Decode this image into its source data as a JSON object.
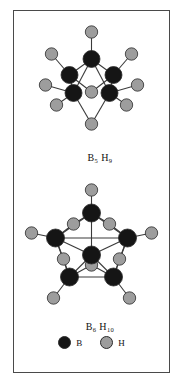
{
  "figure": {
    "background_color": "#ffffff",
    "border_color": "#4a4a4a",
    "atom_colors": {
      "boron": "#151515",
      "hydrogen": "#9d9d9d",
      "bond": "#3a3a3a",
      "outline": "#2b2b2b"
    }
  },
  "structures": [
    {
      "id": "pentaborane",
      "formula_element": "B",
      "formula_sub1": "5",
      "formula_element2": "H",
      "formula_sub2": "9",
      "formula_plain": "B5 H9",
      "boron_count": 5,
      "hydrogen_count": 9,
      "atoms": [
        {
          "label": "B",
          "type": "boron",
          "x": 62,
          "y": 36,
          "r": 8.5
        },
        {
          "label": "B",
          "type": "boron",
          "x": 40,
          "y": 52,
          "r": 8.5
        },
        {
          "label": "B",
          "type": "boron",
          "x": 84,
          "y": 52,
          "r": 8.5
        },
        {
          "label": "B",
          "type": "boron",
          "x": 44,
          "y": 70,
          "r": 8.5
        },
        {
          "label": "B",
          "type": "boron",
          "x": 80,
          "y": 70,
          "r": 8.5
        },
        {
          "label": "H",
          "type": "hydrogen",
          "x": 62,
          "y": 9,
          "r": 6.2
        },
        {
          "label": "H",
          "type": "hydrogen",
          "x": 22,
          "y": 31,
          "r": 6.2
        },
        {
          "label": "H",
          "type": "hydrogen",
          "x": 102,
          "y": 31,
          "r": 6.2
        },
        {
          "label": "H",
          "type": "hydrogen",
          "x": 16,
          "y": 62,
          "r": 6.2
        },
        {
          "label": "H",
          "type": "hydrogen",
          "x": 108,
          "y": 62,
          "r": 6.2
        },
        {
          "label": "H",
          "type": "hydrogen",
          "x": 27,
          "y": 82,
          "r": 6.2
        },
        {
          "label": "H",
          "type": "hydrogen",
          "x": 97,
          "y": 82,
          "r": 6.2
        },
        {
          "label": "H",
          "type": "hydrogen",
          "x": 62,
          "y": 69,
          "r": 6.2
        },
        {
          "label": "H",
          "type": "hydrogen",
          "x": 62,
          "y": 101,
          "r": 6.2
        }
      ],
      "bonds": [
        {
          "from": 0,
          "to": 5
        },
        {
          "from": 0,
          "to": 1
        },
        {
          "from": 0,
          "to": 2
        },
        {
          "from": 0,
          "to": 3
        },
        {
          "from": 0,
          "to": 4
        },
        {
          "from": 1,
          "to": 3
        },
        {
          "from": 2,
          "to": 4
        },
        {
          "from": 1,
          "to": 6
        },
        {
          "from": 2,
          "to": 7
        },
        {
          "from": 3,
          "to": 8
        },
        {
          "from": 4,
          "to": 9
        },
        {
          "from": 3,
          "to": 10
        },
        {
          "from": 4,
          "to": 11
        },
        {
          "from": 1,
          "to": 12
        },
        {
          "from": 2,
          "to": 12
        },
        {
          "from": 3,
          "to": 13
        },
        {
          "from": 4,
          "to": 13
        }
      ]
    },
    {
      "id": "hexaborane",
      "formula_element": "B",
      "formula_sub1": "6",
      "formula_element2": "H",
      "formula_sub2": "10",
      "formula_plain": "B6 H10",
      "boron_count": 6,
      "hydrogen_count": 10,
      "atoms": [
        {
          "label": "B",
          "type": "boron",
          "x": 62,
          "y": 28,
          "r": 9
        },
        {
          "label": "B",
          "type": "boron",
          "x": 26,
          "y": 53,
          "r": 9
        },
        {
          "label": "B",
          "type": "boron",
          "x": 98,
          "y": 53,
          "r": 9
        },
        {
          "label": "B",
          "type": "boron",
          "x": 40,
          "y": 92,
          "r": 9
        },
        {
          "label": "B",
          "type": "boron",
          "x": 84,
          "y": 92,
          "r": 9
        },
        {
          "label": "B",
          "type": "boron",
          "x": 62,
          "y": 70,
          "r": 9
        },
        {
          "label": "H",
          "type": "hydrogen",
          "x": 62,
          "y": 5,
          "r": 6.2
        },
        {
          "label": "H",
          "type": "hydrogen",
          "x": 2,
          "y": 48,
          "r": 6.2
        },
        {
          "label": "H",
          "type": "hydrogen",
          "x": 122,
          "y": 48,
          "r": 6.2
        },
        {
          "label": "H",
          "type": "hydrogen",
          "x": 24,
          "y": 113,
          "r": 6.2
        },
        {
          "label": "H",
          "type": "hydrogen",
          "x": 100,
          "y": 113,
          "r": 6.2
        },
        {
          "label": "H",
          "type": "hydrogen",
          "x": 44,
          "y": 39,
          "r": 6.2
        },
        {
          "label": "H",
          "type": "hydrogen",
          "x": 80,
          "y": 39,
          "r": 6.2
        },
        {
          "label": "H",
          "type": "hydrogen",
          "x": 34,
          "y": 74,
          "r": 6.2
        },
        {
          "label": "H",
          "type": "hydrogen",
          "x": 90,
          "y": 74,
          "r": 6.2
        },
        {
          "label": "H",
          "type": "hydrogen",
          "x": 62,
          "y": 80,
          "r": 6.2
        }
      ],
      "bonds": [
        {
          "from": 0,
          "to": 6
        },
        {
          "from": 0,
          "to": 1
        },
        {
          "from": 0,
          "to": 2
        },
        {
          "from": 0,
          "to": 5
        },
        {
          "from": 1,
          "to": 2
        },
        {
          "from": 1,
          "to": 3
        },
        {
          "from": 2,
          "to": 4
        },
        {
          "from": 3,
          "to": 4
        },
        {
          "from": 1,
          "to": 5
        },
        {
          "from": 2,
          "to": 5
        },
        {
          "from": 3,
          "to": 5
        },
        {
          "from": 4,
          "to": 5
        },
        {
          "from": 1,
          "to": 7
        },
        {
          "from": 2,
          "to": 8
        },
        {
          "from": 3,
          "to": 9
        },
        {
          "from": 4,
          "to": 10
        },
        {
          "from": 0,
          "to": 11
        },
        {
          "from": 0,
          "to": 12
        },
        {
          "from": 1,
          "to": 11
        },
        {
          "from": 2,
          "to": 12
        },
        {
          "from": 1,
          "to": 13
        },
        {
          "from": 3,
          "to": 13
        },
        {
          "from": 2,
          "to": 14
        },
        {
          "from": 4,
          "to": 14
        },
        {
          "from": 3,
          "to": 15
        },
        {
          "from": 4,
          "to": 15
        }
      ]
    }
  ],
  "legend": {
    "items": [
      {
        "symbol": "B",
        "type": "boron",
        "color": "#151515"
      },
      {
        "symbol": "H",
        "type": "hydrogen",
        "color": "#9d9d9d"
      }
    ]
  }
}
